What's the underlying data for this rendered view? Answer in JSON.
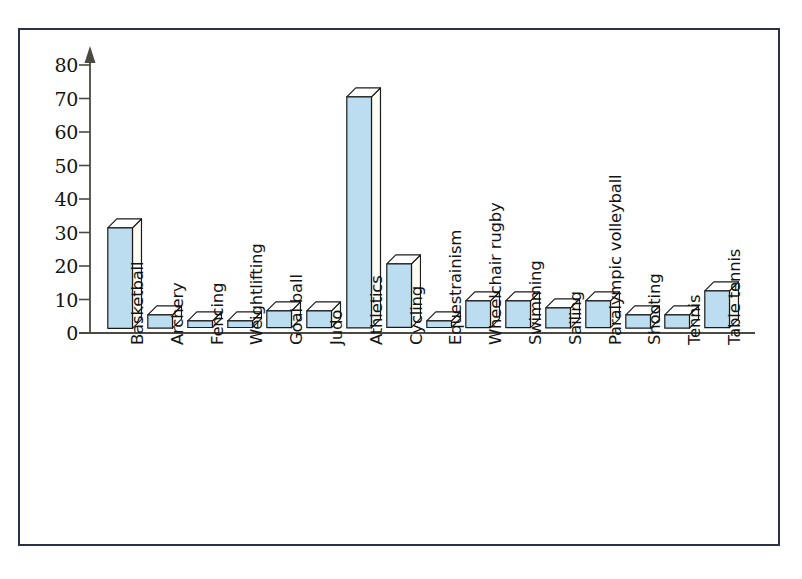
{
  "figure": {
    "frame_color": "#2b3148",
    "background": "#ffffff"
  },
  "chart_data": {
    "type": "bar",
    "title": "",
    "subtitle": "",
    "xlabel": "",
    "ylabel": "",
    "ylim": [
      0,
      80
    ],
    "yticks": [
      0,
      10,
      20,
      30,
      40,
      50,
      60,
      70,
      80
    ],
    "grid": false,
    "legend": null,
    "orientation": "vertical",
    "style": "3d-block",
    "bar_face_color": "#bcdcf0",
    "bar_top_color": "#ffffff",
    "bar_side_color": "#fdfdf4",
    "bar_edge_color": "#1b1b1b",
    "axis_color": "#4a4a42",
    "y_axis_arrow": true,
    "categories": [
      "Basketball",
      "Archery",
      "Fencing",
      "Weightlifting",
      "Goal ball",
      "Judo",
      "Athletics",
      "Cycling",
      "Equestrainism",
      "Wheelchair rugby",
      "Swimming",
      "Sailing",
      "Paralympic volleyball",
      "Shooting",
      "Tennis",
      "Table tennis"
    ],
    "values": [
      30,
      4,
      2,
      2,
      5,
      5,
      69,
      19,
      2,
      8,
      8,
      6,
      8,
      4,
      4,
      11
    ]
  }
}
